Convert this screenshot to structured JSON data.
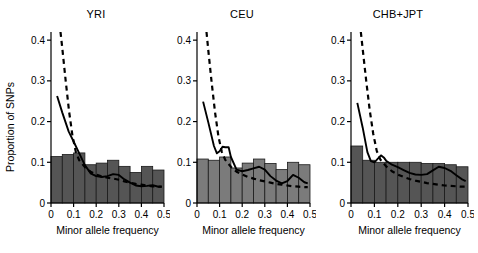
{
  "figure": {
    "ylabel": "Proportion of SNPs",
    "width": 478,
    "height": 253,
    "background": "#ffffff"
  },
  "chart_data": [
    {
      "type": "bar",
      "title": "YRI",
      "xlabel": "Minor allele frequency",
      "ylabel": "Proportion of SNPs",
      "xlim": [
        0,
        0.5
      ],
      "ylim": [
        0,
        0.42
      ],
      "yticks": [
        0,
        0.1,
        0.2,
        0.3,
        0.4
      ],
      "ytick_labels": [
        "0",
        "0.1",
        "0.2",
        "0.3",
        "0.4"
      ],
      "xticks": [
        0,
        0.1,
        0.2,
        0.3,
        0.4,
        0.5
      ],
      "xtick_labels": [
        "0",
        "0.1",
        "0.2",
        "0.3",
        "0.4",
        "0.5"
      ],
      "grid": false,
      "legend": "none",
      "bar_color": "#555555",
      "bin_edges": [
        0,
        0.05,
        0.1,
        0.15,
        0.2,
        0.25,
        0.3,
        0.35,
        0.4,
        0.45,
        0.5
      ],
      "categories": [
        "0-0.05",
        "0.05-0.10",
        "0.10-0.15",
        "0.15-0.20",
        "0.20-0.25",
        "0.25-0.30",
        "0.30-0.35",
        "0.35-0.40",
        "0.40-0.45",
        "0.45-0.50"
      ],
      "values": [
        0.114,
        0.119,
        0.123,
        0.094,
        0.098,
        0.105,
        0.09,
        0.075,
        0.09,
        0.081
      ],
      "series": [
        {
          "name": "solid-curve",
          "style": "solid",
          "x": [
            0.027,
            0.05,
            0.078,
            0.1,
            0.125,
            0.15,
            0.175,
            0.2,
            0.225,
            0.25,
            0.275,
            0.3,
            0.325,
            0.35,
            0.375,
            0.4,
            0.425,
            0.45,
            0.475,
            0.49
          ],
          "values": [
            0.263,
            0.222,
            0.176,
            0.151,
            0.122,
            0.093,
            0.073,
            0.066,
            0.064,
            0.066,
            0.071,
            0.069,
            0.058,
            0.05,
            0.043,
            0.041,
            0.042,
            0.044,
            0.04,
            0.04
          ]
        },
        {
          "name": "dashed-curve",
          "style": "dashed",
          "x": [
            0.042,
            0.05,
            0.065,
            0.08,
            0.095,
            0.11,
            0.125,
            0.15,
            0.175,
            0.2,
            0.225,
            0.25,
            0.275,
            0.3,
            0.325,
            0.35,
            0.375,
            0.4,
            0.425,
            0.45,
            0.475,
            0.49
          ],
          "values": [
            0.42,
            0.38,
            0.3,
            0.225,
            0.165,
            0.125,
            0.105,
            0.088,
            0.077,
            0.07,
            0.065,
            0.062,
            0.06,
            0.057,
            0.053,
            0.05,
            0.047,
            0.045,
            0.043,
            0.041,
            0.04,
            0.04
          ]
        }
      ]
    },
    {
      "type": "bar",
      "title": "CEU",
      "xlabel": "Minor allele frequency",
      "ylabel": "Proportion of SNPs",
      "xlim": [
        0,
        0.5
      ],
      "ylim": [
        0,
        0.42
      ],
      "yticks": [
        0,
        0.1,
        0.2,
        0.3,
        0.4
      ],
      "ytick_labels": [
        "0",
        "0.1",
        "0.2",
        "0.3",
        "0.4"
      ],
      "xticks": [
        0,
        0.1,
        0.2,
        0.3,
        0.4,
        0.5
      ],
      "xtick_labels": [
        "0",
        "0.1",
        "0.2",
        "0.3",
        "0.4",
        "0.5"
      ],
      "grid": false,
      "legend": "none",
      "bar_color": "#7b7b7b",
      "bin_edges": [
        0,
        0.05,
        0.1,
        0.15,
        0.2,
        0.25,
        0.3,
        0.35,
        0.4,
        0.45,
        0.5
      ],
      "categories": [
        "0-0.05",
        "0.05-0.10",
        "0.10-0.15",
        "0.15-0.20",
        "0.20-0.25",
        "0.25-0.30",
        "0.30-0.35",
        "0.35-0.40",
        "0.40-0.45",
        "0.45-0.50"
      ],
      "values": [
        0.108,
        0.105,
        0.113,
        0.086,
        0.098,
        0.108,
        0.097,
        0.082,
        0.1,
        0.094
      ],
      "series": [
        {
          "name": "solid-curve",
          "style": "solid",
          "x": [
            0.027,
            0.05,
            0.075,
            0.088,
            0.1,
            0.113,
            0.125,
            0.14,
            0.15,
            0.175,
            0.2,
            0.225,
            0.25,
            0.275,
            0.3,
            0.325,
            0.35,
            0.375,
            0.4,
            0.425,
            0.45,
            0.475,
            0.49
          ],
          "values": [
            0.249,
            0.198,
            0.14,
            0.122,
            0.127,
            0.138,
            0.137,
            0.137,
            0.113,
            0.082,
            0.078,
            0.081,
            0.085,
            0.089,
            0.082,
            0.066,
            0.055,
            0.048,
            0.054,
            0.069,
            0.062,
            0.051,
            0.048
          ]
        },
        {
          "name": "dashed-curve",
          "style": "dashed",
          "x": [
            0.042,
            0.05,
            0.065,
            0.08,
            0.095,
            0.11,
            0.125,
            0.15,
            0.175,
            0.2,
            0.225,
            0.25,
            0.275,
            0.3,
            0.325,
            0.35,
            0.375,
            0.4,
            0.425,
            0.45,
            0.475,
            0.49
          ],
          "values": [
            0.42,
            0.375,
            0.295,
            0.222,
            0.163,
            0.125,
            0.106,
            0.089,
            0.077,
            0.07,
            0.064,
            0.06,
            0.056,
            0.053,
            0.05,
            0.047,
            0.045,
            0.043,
            0.041,
            0.04,
            0.039,
            0.039
          ]
        }
      ]
    },
    {
      "type": "bar",
      "title": "CHB+JPT",
      "xlabel": "Minor allele frequency",
      "ylabel": "Proportion of SNPs",
      "xlim": [
        0,
        0.5
      ],
      "ylim": [
        0,
        0.42
      ],
      "yticks": [
        0,
        0.1,
        0.2,
        0.3,
        0.4
      ],
      "ytick_labels": [
        "0",
        "0.1",
        "0.2",
        "0.3",
        "0.4"
      ],
      "xticks": [
        0,
        0.1,
        0.2,
        0.3,
        0.4,
        0.5
      ],
      "xtick_labels": [
        "0",
        "0.1",
        "0.2",
        "0.3",
        "0.4",
        "0.5"
      ],
      "grid": false,
      "legend": "none",
      "bar_color": "#555555",
      "bin_edges": [
        0,
        0.05,
        0.1,
        0.15,
        0.2,
        0.25,
        0.3,
        0.35,
        0.4,
        0.45,
        0.5
      ],
      "categories": [
        "0-0.05",
        "0.05-0.10",
        "0.10-0.15",
        "0.15-0.20",
        "0.20-0.25",
        "0.25-0.30",
        "0.30-0.35",
        "0.35-0.40",
        "0.40-0.45",
        "0.45-0.50"
      ],
      "values": [
        0.14,
        0.105,
        0.1,
        0.1,
        0.1,
        0.1,
        0.097,
        0.097,
        0.094,
        0.089
      ],
      "series": [
        {
          "name": "solid-curve",
          "style": "solid",
          "x": [
            0.027,
            0.05,
            0.07,
            0.085,
            0.1,
            0.113,
            0.128,
            0.14,
            0.15,
            0.175,
            0.2,
            0.225,
            0.25,
            0.275,
            0.3,
            0.325,
            0.35,
            0.375,
            0.4,
            0.425,
            0.45,
            0.475,
            0.49
          ],
          "values": [
            0.246,
            0.185,
            0.125,
            0.103,
            0.1,
            0.108,
            0.117,
            0.112,
            0.104,
            0.094,
            0.088,
            0.081,
            0.074,
            0.07,
            0.069,
            0.071,
            0.08,
            0.089,
            0.086,
            0.079,
            0.068,
            0.058,
            0.054
          ]
        },
        {
          "name": "dashed-curve",
          "style": "dashed",
          "x": [
            0.042,
            0.05,
            0.065,
            0.08,
            0.095,
            0.11,
            0.125,
            0.15,
            0.175,
            0.2,
            0.225,
            0.25,
            0.275,
            0.3,
            0.325,
            0.35,
            0.375,
            0.4,
            0.425,
            0.45,
            0.475,
            0.49
          ],
          "values": [
            0.42,
            0.378,
            0.3,
            0.228,
            0.17,
            0.128,
            0.107,
            0.09,
            0.078,
            0.07,
            0.064,
            0.059,
            0.055,
            0.052,
            0.049,
            0.047,
            0.045,
            0.043,
            0.042,
            0.041,
            0.04,
            0.04
          ]
        }
      ]
    }
  ]
}
